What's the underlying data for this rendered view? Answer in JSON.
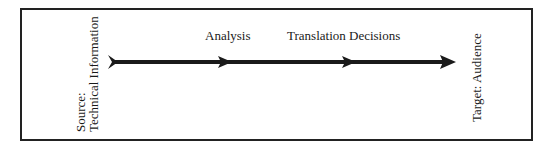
{
  "diagram": {
    "source_label_line1": "Source:",
    "source_label_line2": "Technical Information",
    "target_label": "Target: Audience",
    "stages": [
      {
        "label": "Analysis"
      },
      {
        "label": "Translation Decisions"
      }
    ],
    "colors": {
      "line": "#1a1a1a",
      "border": "#222222"
    }
  }
}
